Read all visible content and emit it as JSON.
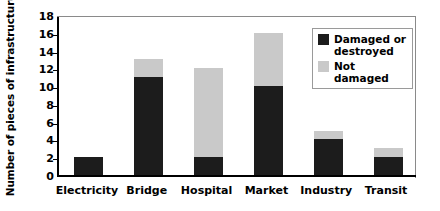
{
  "chart_data": {
    "type": "bar",
    "subtype": "stacked-bar",
    "title": "",
    "xlabel": "",
    "ylabel": "Number of pieces of infrastructure",
    "ylim": [
      0,
      18
    ],
    "ytick_step": 2,
    "yticks": [
      18,
      16,
      14,
      12,
      10,
      8,
      6,
      4,
      2,
      0
    ],
    "categories": [
      "Electricity",
      "Bridge",
      "Hospital",
      "Market",
      "Industry",
      "Transit"
    ],
    "series": [
      {
        "name": "Damaged or destroyed",
        "color": "#1c1c1c",
        "values": [
          2,
          11,
          2,
          10,
          4,
          2
        ]
      },
      {
        "name": "Not damaged",
        "color": "#c9c9c9",
        "values": [
          0,
          2,
          10,
          6,
          1,
          1
        ]
      }
    ],
    "totals": [
      2,
      13,
      12,
      16,
      5,
      3
    ],
    "grid": false,
    "legend_position": "top-right"
  },
  "legend": {
    "entries": [
      {
        "label": "Damaged or destroyed",
        "color": "#1c1c1c"
      },
      {
        "label": "Not damaged",
        "color": "#c9c9c9"
      }
    ]
  },
  "colors": {
    "damaged": "#1c1c1c",
    "not_damaged": "#c9c9c9",
    "axis": "#000000",
    "frame": "#8a8a8a",
    "background": "#ffffff"
  }
}
